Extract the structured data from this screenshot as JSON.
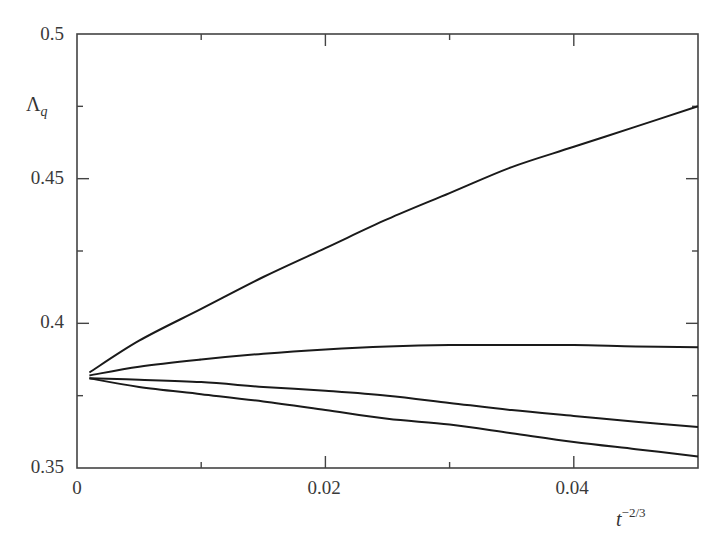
{
  "chart_data": {
    "type": "line",
    "title": "",
    "xlabel": "t^{-2/3}",
    "ylabel": "Λ_q",
    "xlim": [
      0,
      0.05
    ],
    "ylim": [
      0.35,
      0.5
    ],
    "grid": false,
    "legend": null,
    "x_ticks": {
      "major": [
        0,
        0.02,
        0.04
      ],
      "minor": [
        0.01,
        0.03
      ]
    },
    "x_tick_labels": [
      "0",
      "0.02",
      "0.04"
    ],
    "y_ticks": {
      "major": [
        0.35,
        0.4,
        0.45,
        0.5
      ],
      "minor": [
        0.375,
        0.425,
        0.475
      ]
    },
    "y_tick_labels": [
      "0.35",
      "0.4",
      "0.45",
      "0.5"
    ],
    "x": [
      0.001,
      0.005,
      0.01,
      0.015,
      0.02,
      0.025,
      0.03,
      0.035,
      0.04,
      0.045,
      0.05
    ],
    "series": [
      {
        "name": "curve-1",
        "values": [
          0.383,
          0.394,
          0.405,
          0.416,
          0.426,
          0.436,
          0.445,
          0.454,
          0.461,
          0.468,
          0.475
        ]
      },
      {
        "name": "curve-2",
        "values": [
          0.382,
          0.385,
          0.3875,
          0.3895,
          0.391,
          0.392,
          0.3925,
          0.3925,
          0.3925,
          0.392,
          0.3917
        ]
      },
      {
        "name": "curve-3",
        "values": [
          0.381,
          0.3805,
          0.3797,
          0.378,
          0.3767,
          0.375,
          0.3725,
          0.37,
          0.368,
          0.366,
          0.3642
        ]
      },
      {
        "name": "curve-4",
        "values": [
          0.381,
          0.378,
          0.3755,
          0.373,
          0.37,
          0.367,
          0.365,
          0.362,
          0.359,
          0.3565,
          0.354
        ]
      }
    ],
    "line_color": "#1a1a1a",
    "axis_color": "#444444"
  },
  "labels": {
    "y_main": "Λ",
    "y_sub": "q",
    "x_main": "t",
    "x_sup": "−2/3",
    "y_ticks": [
      "0.5",
      "0.45",
      "0.4",
      "0.35"
    ],
    "x_ticks": [
      "0",
      "0.02",
      "0.04"
    ]
  }
}
